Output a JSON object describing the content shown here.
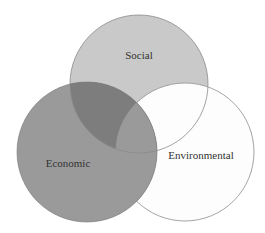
{
  "diagram": {
    "type": "venn",
    "sets": [
      {
        "id": "social",
        "label": "Social",
        "cx": 139,
        "cy": 84,
        "r": 69,
        "fill": "#c9c9c9",
        "stroke": "#8a8a8a",
        "label_x": 139,
        "label_y": 59
      },
      {
        "id": "environmental",
        "label": "Environmental",
        "cx": 185,
        "cy": 152,
        "r": 69,
        "fill": "#fdfdfd",
        "stroke": "#9a9a9a",
        "label_x": 201,
        "label_y": 159
      },
      {
        "id": "economic",
        "label": "Economic",
        "cx": 87,
        "cy": 152,
        "r": 70,
        "fill": "#9a9a9a",
        "stroke": "#777777",
        "label_x": 68,
        "label_y": 167
      }
    ],
    "overlap_colors": {
      "social_economic": "#7d7d7d",
      "economic_environmental": "#9a9a9a",
      "social_environmental": "#fafafa"
    }
  }
}
